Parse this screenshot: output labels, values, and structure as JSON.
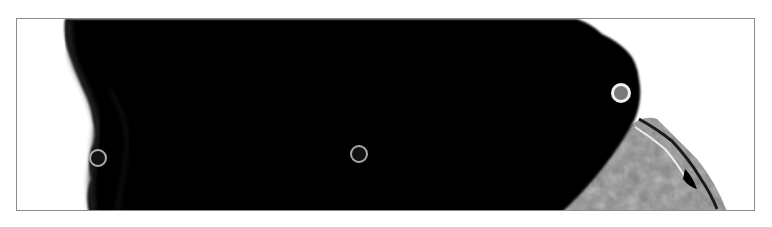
{
  "image": {
    "description": "Grayscale close-up: large black silhouette filling the frame against white background, with a textured gray region at lower right",
    "colors": {
      "background": "#ffffff",
      "silhouette": "#000000",
      "texture_gray": "#8a8a8a",
      "frame_border": "#8c8c8c"
    }
  },
  "markers": [
    {
      "id": "left",
      "x": 97,
      "y": 157,
      "style": "ring",
      "ring_color": "#b0b0b0",
      "fill": "#111111",
      "diameter": 18
    },
    {
      "id": "center",
      "x": 358,
      "y": 153,
      "style": "ring",
      "ring_color": "#a8a8a8",
      "fill": "#111111",
      "diameter": 18
    },
    {
      "id": "right",
      "x": 620,
      "y": 92,
      "style": "filled-ring",
      "ring_color": "#f2f2f2",
      "fill": "#7a7a7a",
      "diameter": 20
    }
  ]
}
